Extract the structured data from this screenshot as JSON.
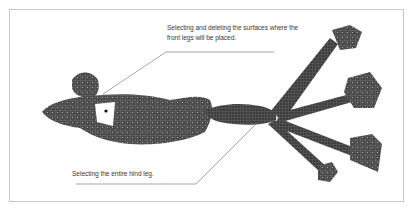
{
  "figure": {
    "callouts": [
      {
        "id": "front-legs",
        "text_line1": "Selecting and deleting the surfaces where the",
        "text_line2": "front legs will be placed."
      },
      {
        "id": "hind-leg",
        "text_line1": "Selecting the entire hind leg."
      }
    ]
  },
  "colors": {
    "frame_border": "#c8c8c8",
    "mesh_dark": "#3c3c3c",
    "mesh_mid": "#5a5a5a",
    "mesh_light": "#7a7a7a",
    "wire": "#9a9a9a",
    "leader": "#6a6a6a",
    "text": "#3a3a3a"
  }
}
